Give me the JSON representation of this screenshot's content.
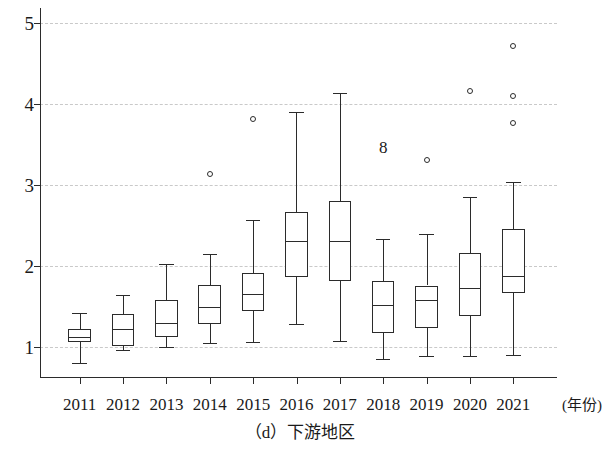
{
  "figure": {
    "caption": "（d）下游地区"
  },
  "axes": {
    "x_axis_title": "(年份)",
    "y_ticks": [
      "1",
      "2",
      "3",
      "4",
      "5"
    ],
    "x_ticks": [
      "2011",
      "2012",
      "2013",
      "2014",
      "2015",
      "2016",
      "2017",
      "2018",
      "2019",
      "2020",
      "2021"
    ]
  },
  "annotations": [
    {
      "text": "8",
      "x": 2018,
      "y": 3.47
    }
  ],
  "style": {
    "line_color": "#2b2b2b",
    "grid_color": "#c9c9c9",
    "box_fill": "#ffffff",
    "background": "#ffffff"
  },
  "chart_data": {
    "type": "box",
    "title": "（d）下游地区",
    "xlabel": "(年份)",
    "ylabel": "",
    "ylim": [
      0.62,
      5.18
    ],
    "yticks": [
      1,
      2,
      3,
      4,
      5
    ],
    "grid": true,
    "legend": "none",
    "categories": [
      "2011",
      "2012",
      "2013",
      "2014",
      "2015",
      "2016",
      "2017",
      "2018",
      "2019",
      "2020",
      "2021"
    ],
    "boxes": [
      {
        "category": "2011",
        "whisker_low": 0.81,
        "q1": 1.06,
        "median": 1.12,
        "q3": 1.22,
        "whisker_high": 1.42,
        "outliers": []
      },
      {
        "category": "2012",
        "whisker_low": 0.96,
        "q1": 1.02,
        "median": 1.22,
        "q3": 1.41,
        "whisker_high": 1.64,
        "outliers": []
      },
      {
        "category": "2013",
        "whisker_low": 1.0,
        "q1": 1.13,
        "median": 1.3,
        "q3": 1.58,
        "whisker_high": 2.02,
        "outliers": []
      },
      {
        "category": "2014",
        "whisker_low": 1.05,
        "q1": 1.28,
        "median": 1.49,
        "q3": 1.77,
        "whisker_high": 2.15,
        "outliers": [
          3.14
        ]
      },
      {
        "category": "2015",
        "whisker_low": 1.06,
        "q1": 1.45,
        "median": 1.65,
        "q3": 1.92,
        "whisker_high": 2.57,
        "outliers": [
          3.81
        ]
      },
      {
        "category": "2016",
        "whisker_low": 1.28,
        "q1": 1.87,
        "median": 2.31,
        "q3": 2.67,
        "whisker_high": 3.9,
        "outliers": []
      },
      {
        "category": "2017",
        "whisker_low": 1.07,
        "q1": 1.81,
        "median": 2.31,
        "q3": 2.8,
        "whisker_high": 4.13,
        "outliers": []
      },
      {
        "category": "2018",
        "whisker_low": 0.86,
        "q1": 1.17,
        "median": 1.52,
        "q3": 1.81,
        "whisker_high": 2.33,
        "outliers": []
      },
      {
        "category": "2019",
        "whisker_low": 0.89,
        "q1": 1.24,
        "median": 1.58,
        "q3": 1.76,
        "whisker_high": 2.39,
        "outliers": [
          3.31
        ]
      },
      {
        "category": "2020",
        "whisker_low": 0.89,
        "q1": 1.39,
        "median": 1.73,
        "q3": 2.16,
        "whisker_high": 2.85,
        "outliers": [
          4.16
        ]
      },
      {
        "category": "2021",
        "whisker_low": 0.9,
        "q1": 1.67,
        "median": 1.88,
        "q3": 2.46,
        "whisker_high": 3.04,
        "outliers": [
          4.71,
          4.1,
          3.76
        ]
      }
    ]
  }
}
